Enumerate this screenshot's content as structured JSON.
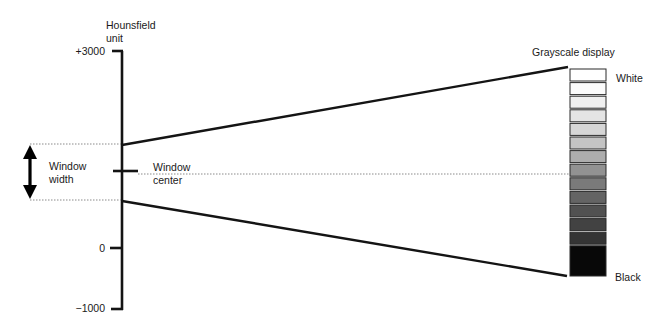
{
  "axis": {
    "title_line1": "Hounsfield",
    "title_line2": "unit",
    "ticks": [
      {
        "label": "+3000",
        "y": 52
      },
      {
        "label": "0",
        "y": 248
      },
      {
        "label": "−1000",
        "y": 308
      }
    ]
  },
  "window": {
    "width_label_line1": "Window",
    "width_label_line2": "width",
    "center_label_line1": "Window",
    "center_label_line2": "center",
    "upper_y": 144,
    "lower_y": 200,
    "center_y": 172
  },
  "grayscale": {
    "title": "Grayscale display",
    "white_label": "White",
    "black_label": "Black",
    "cells": [
      "#ffffff",
      "#fbfbfb",
      "#f0f0f0",
      "#e4e4e4",
      "#d6d6d6",
      "#c4c4c4",
      "#adadad",
      "#929292",
      "#7a7a7a",
      "#646464",
      "#515151",
      "#424242",
      "#343434",
      "#080808"
    ]
  },
  "colors": {
    "line": "#141414",
    "dotted": "#8a8a8a"
  }
}
